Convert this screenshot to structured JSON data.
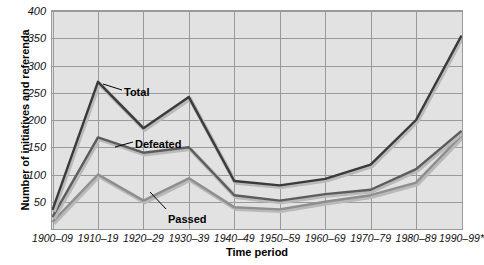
{
  "chart_data": {
    "type": "line",
    "title": "",
    "xlabel": "Time period",
    "ylabel": "Number of initiatives and referenda",
    "categories": [
      "1900–09",
      "1910–19",
      "1920–29",
      "1930–39",
      "1940–49",
      "1950–59",
      "1960–69",
      "1970–79",
      "1980–89",
      "1990–99*"
    ],
    "series": [
      {
        "name": "Total",
        "values": [
          35,
          270,
          185,
          242,
          88,
          80,
          92,
          118,
          200,
          355
        ],
        "color": "#3a3a3a"
      },
      {
        "name": "Defeated",
        "values": [
          22,
          168,
          140,
          150,
          62,
          52,
          64,
          72,
          110,
          180
        ],
        "color": "#5c5c5c"
      },
      {
        "name": "Passed",
        "values": [
          13,
          100,
          52,
          93,
          40,
          36,
          50,
          62,
          85,
          172
        ],
        "color": "#8e8e8e"
      }
    ],
    "ylim": [
      0,
      400
    ],
    "ytick_values": [
      400,
      350,
      300,
      250,
      200,
      150,
      100,
      50
    ],
    "ytick_labels": [
      "400",
      "350",
      "300",
      "250",
      "200",
      "150",
      "100",
      "50"
    ],
    "grid": true,
    "legend_position": "inline-annotations",
    "annotations": [
      {
        "label": "Total",
        "series": "Total",
        "x_px": 124,
        "y_px": 86
      },
      {
        "label": "Defeated",
        "series": "Defeated",
        "x_px": 135,
        "y_px": 138
      },
      {
        "label": "Passed",
        "series": "Passed",
        "x_px": 168,
        "y_px": 213
      }
    ],
    "plot_background": "#e2e2e2",
    "grid_color": "#9a9a9a"
  }
}
